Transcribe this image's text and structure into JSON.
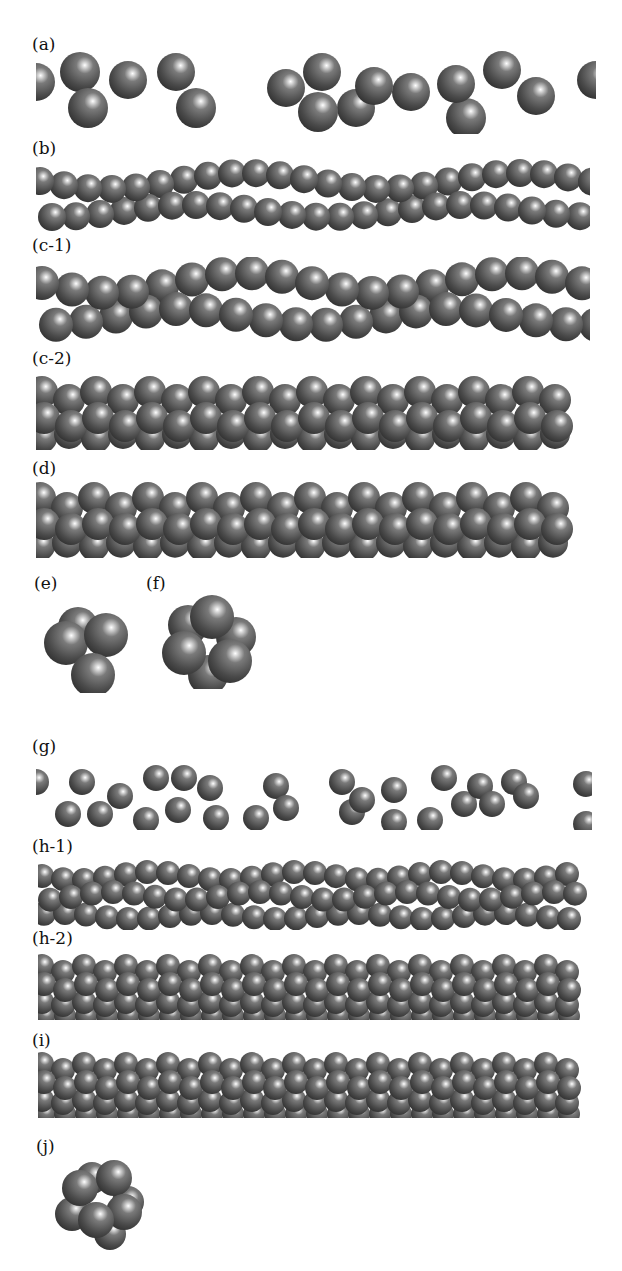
{
  "figure": {
    "sphere_color": "#5a5a5a",
    "highlight_color": "#ffffff",
    "panels": [
      {
        "id": "a",
        "label": "(a)",
        "structure": "dispersed-chain",
        "size": "large"
      },
      {
        "id": "b",
        "label": "(b)",
        "structure": "twisted-double-row",
        "size": "medium"
      },
      {
        "id": "c-1",
        "label": "(c-1)",
        "structure": "twisted-double-row",
        "size": "large"
      },
      {
        "id": "c-2",
        "label": "(c-2)",
        "structure": "triple-row-helix",
        "size": "large"
      },
      {
        "id": "d",
        "label": "(d)",
        "structure": "triple-row-helix",
        "size": "large"
      },
      {
        "id": "e",
        "label": "(e)",
        "structure": "cross-section-4",
        "size": "large"
      },
      {
        "id": "f",
        "label": "(f)",
        "structure": "cross-section-6",
        "size": "large"
      },
      {
        "id": "g",
        "label": "(g)",
        "structure": "dispersed-chain",
        "size": "small"
      },
      {
        "id": "h-1",
        "label": "(h-1)",
        "structure": "triple-row-helix",
        "size": "small"
      },
      {
        "id": "h-2",
        "label": "(h-2)",
        "structure": "quad-row-helix",
        "size": "small"
      },
      {
        "id": "i",
        "label": "(i)",
        "structure": "quad-row-helix",
        "size": "small"
      },
      {
        "id": "j",
        "label": "(j)",
        "structure": "cross-section-5",
        "size": "small"
      }
    ]
  }
}
